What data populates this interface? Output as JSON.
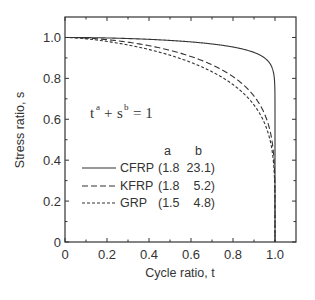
{
  "chart_data": {
    "type": "line",
    "title": "",
    "xlabel": "Cycle ratio, t",
    "ylabel": "Stress ratio, s",
    "xlim": [
      0,
      1.1
    ],
    "ylim": [
      0,
      1.1
    ],
    "xticks": [
      0,
      0.2,
      0.4,
      0.6,
      0.8,
      1.0
    ],
    "xtick_labels": [
      "0",
      "0.2",
      "0.4",
      "0.6",
      "0.8",
      "1.0"
    ],
    "yticks": [
      0,
      0.2,
      0.4,
      0.6,
      0.8,
      1.0
    ],
    "ytick_labels": [
      "0",
      "0.2",
      "0.4",
      "0.6",
      "0.8",
      "1.0"
    ],
    "minor_xticks": [
      0.1,
      0.3,
      0.5,
      0.7,
      0.9
    ],
    "minor_yticks": [
      0.1,
      0.3,
      0.5,
      0.7,
      0.9
    ],
    "grid": false,
    "equation": {
      "base1": "t",
      "exp1": "a",
      "plus": "+",
      "base2": "s",
      "exp2": "b",
      "rhs": "= 1"
    },
    "legend": {
      "placement": "center-left",
      "header_a": "a",
      "header_b": "b"
    },
    "series": [
      {
        "name": "CFRP",
        "a": 1.8,
        "b": 23.1,
        "a_label": "(1.8",
        "b_label": "23.1)",
        "style": "solid"
      },
      {
        "name": "KFRP",
        "a": 1.8,
        "b": 5.2,
        "a_label": "(1.8",
        "b_label": "5.2)",
        "style": "dashed"
      },
      {
        "name": "GRP",
        "a": 1.5,
        "b": 4.8,
        "a_label": "(1.5",
        "b_label": "4.8)",
        "style": "short-dashed"
      }
    ]
  }
}
